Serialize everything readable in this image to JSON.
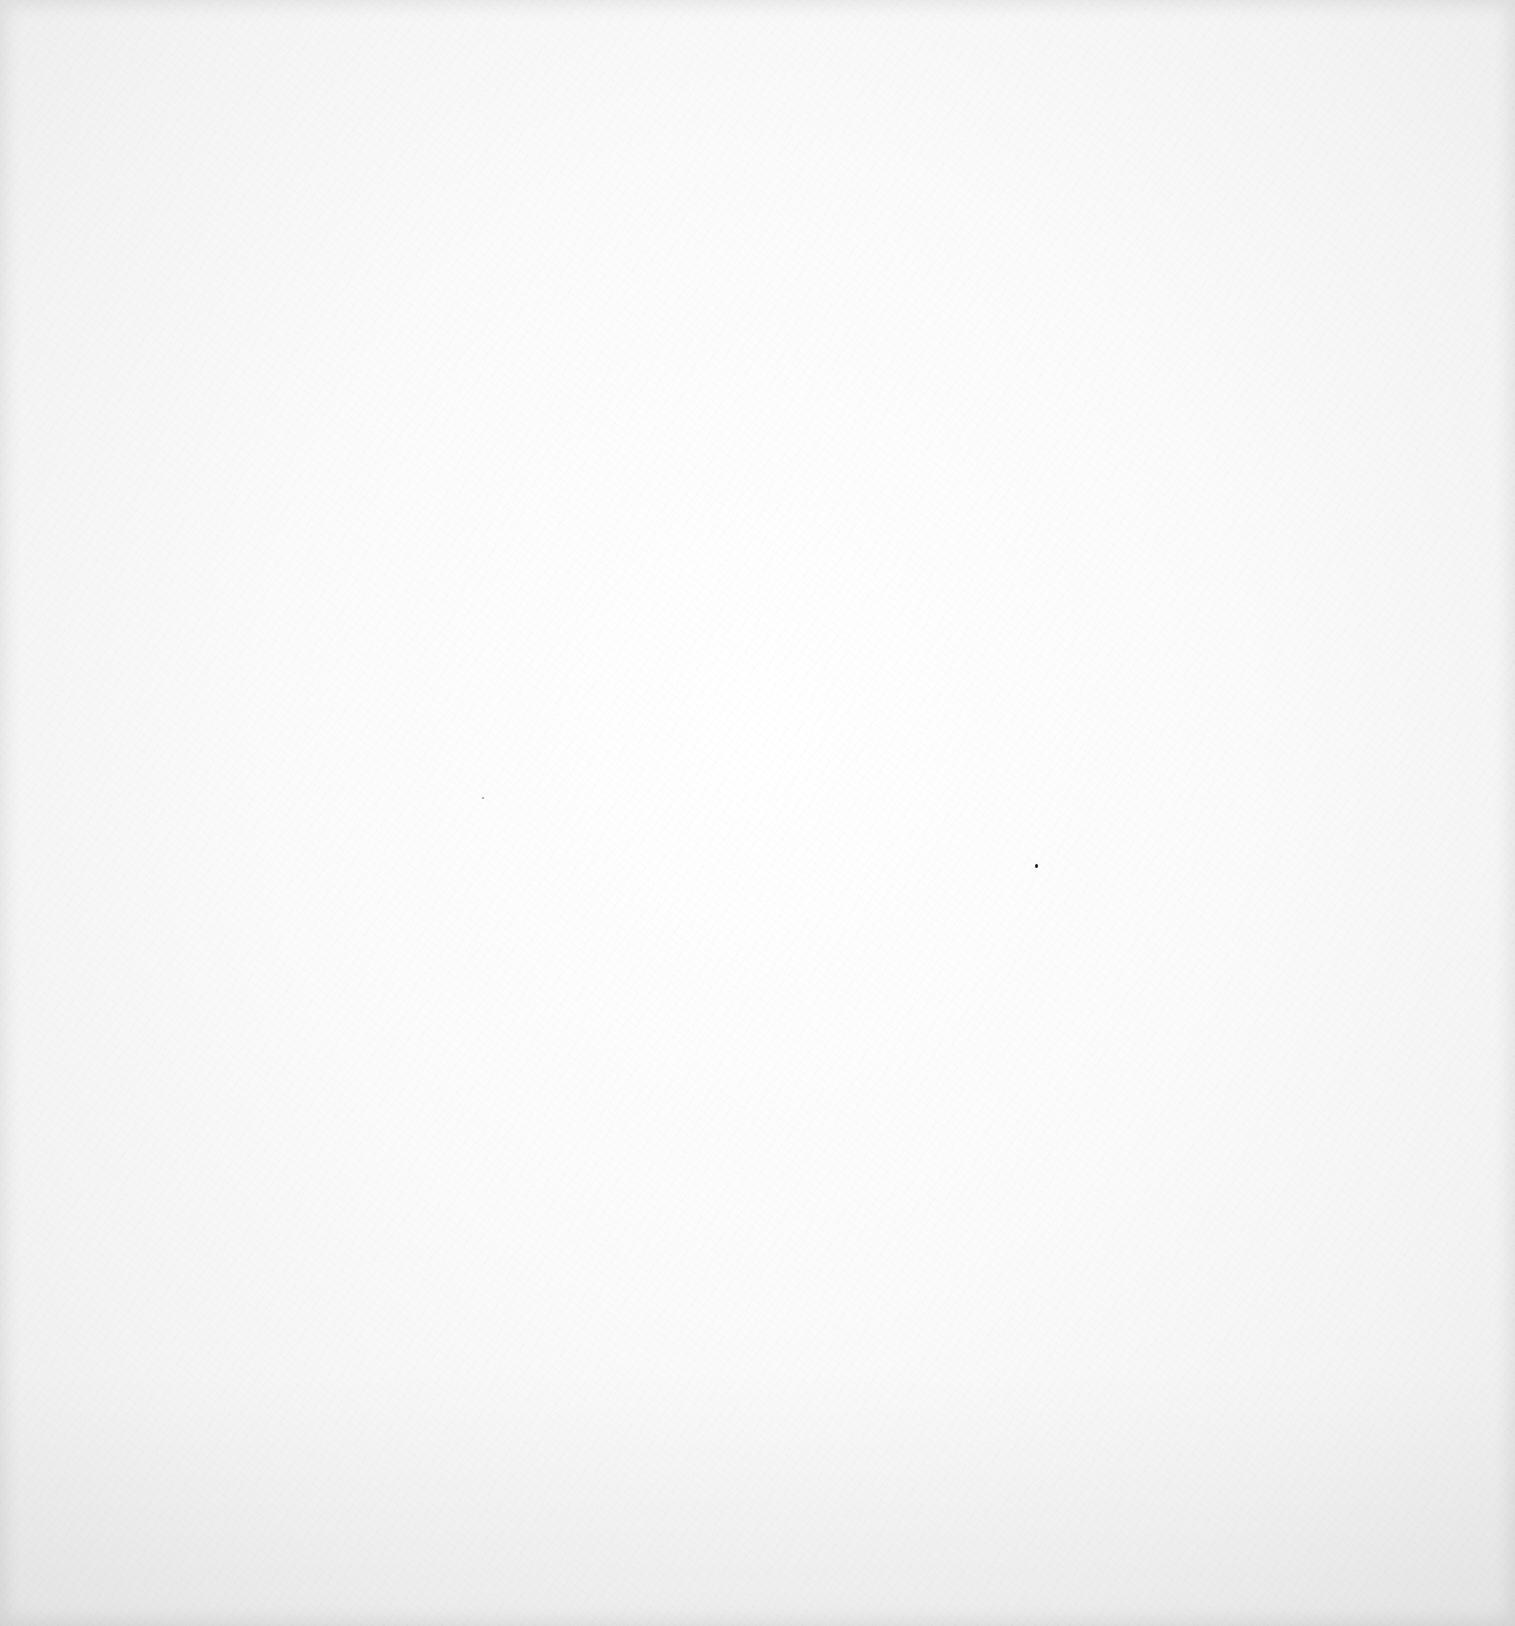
{
  "page": {
    "background_color": "#fafafa",
    "edge_color": "#e6e6e6",
    "text": []
  },
  "marks": [
    {
      "kind": "speck",
      "x": 1035,
      "y": 864,
      "color": "#1a1a1a"
    },
    {
      "kind": "faint-speck",
      "x": 482,
      "y": 797,
      "color": "#9a9a9a"
    }
  ]
}
